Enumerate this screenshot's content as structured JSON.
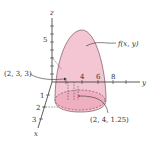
{
  "diagram": {
    "axes": {
      "z_label": "z",
      "y_label": "y",
      "x_label": "x",
      "z_ticks": [
        "5"
      ],
      "y_ticks": [
        "4",
        "6",
        "8"
      ],
      "x_ticks": [
        "1",
        "2",
        "3"
      ]
    },
    "surface_label": "f(x, y)",
    "point_labels": {
      "p1": "(2, 3, 3)",
      "p2": "(2, 4, 1.25)"
    },
    "colors": {
      "surface_fill": "#f4c6d3",
      "surface_base": "#ec9fb6",
      "outline": "#5a2a3a",
      "axis": "#333333"
    }
  }
}
